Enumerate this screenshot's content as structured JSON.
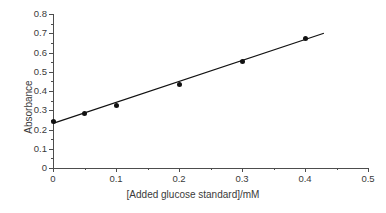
{
  "chart_data": {
    "type": "scatter",
    "title": "",
    "xlabel": "[Added glucose standard]/mM",
    "ylabel": "Absorbance",
    "xlim": [
      0,
      0.5
    ],
    "ylim": [
      0,
      0.8
    ],
    "grid": false,
    "legend": null,
    "x_ticks": [
      "0",
      "0.1",
      "0.2",
      "0.3",
      "0.4",
      "0.5"
    ],
    "x_tick_values": [
      0,
      0.1,
      0.2,
      0.3,
      0.4,
      0.5
    ],
    "x_minor_tick_values": [
      0.05,
      0.15,
      0.25,
      0.35,
      0.45
    ],
    "y_ticks": [
      "0",
      "0.1",
      "0.2",
      "0.3",
      "0.4",
      "0.5",
      "0.6",
      "0.7",
      "0.8"
    ],
    "y_tick_values": [
      0,
      0.1,
      0.2,
      0.3,
      0.4,
      0.5,
      0.6,
      0.7,
      0.8
    ],
    "y_minor_tick_values": [
      0.05,
      0.15,
      0.25,
      0.35,
      0.45,
      0.55,
      0.65,
      0.75
    ],
    "x": [
      0,
      0.05,
      0.1,
      0.2,
      0.3,
      0.4
    ],
    "values": [
      0.242,
      0.285,
      0.325,
      0.435,
      0.553,
      0.671
    ],
    "series": [
      {
        "name": "Standard addition points",
        "marker": "filled-circle",
        "color": "#111111",
        "x": [
          0,
          0.05,
          0.1,
          0.2,
          0.3,
          0.4
        ],
        "values": [
          0.242,
          0.285,
          0.325,
          0.435,
          0.553,
          0.671
        ]
      },
      {
        "name": "Linear fit",
        "type": "line",
        "color": "#111111",
        "x": [
          0,
          0.43
        ],
        "values": [
          0.232,
          0.7
        ],
        "slope": 1.089,
        "intercept": 0.232
      }
    ],
    "axis_color": "#4d4d4d",
    "background": "#ffffff"
  }
}
